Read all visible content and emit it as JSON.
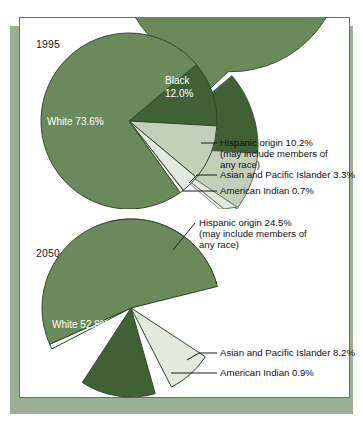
{
  "figure": {
    "title_alt": "U.S. population by race and Hispanic origin, 1995 and 2050",
    "colors": {
      "white_slice": "#6b8a5b",
      "black_slice": "#3f6135",
      "hispanic_slice": "#c3cfba",
      "asian_slice": "#e3e9de",
      "american_indian_slice": "#ffffff",
      "slice_outline": "#3f5436",
      "panel_border": "#5e7a56",
      "shadow_block": "#9bad93",
      "panel_background": "#ffffff",
      "text": "#111111",
      "slice_label_text": "#ffffff"
    }
  },
  "charts": [
    {
      "year_label": "1995",
      "inside_labels": [
        {
          "name": "black-slice-label",
          "text": "Black"
        },
        {
          "name": "black-slice-value",
          "text": "12.0%"
        },
        {
          "name": "white-slice-label",
          "text": "White 73.6%"
        }
      ],
      "annotations": [
        {
          "name": "hispanic-callout-line1",
          "text": "Hispanic origin 10.2%"
        },
        {
          "name": "hispanic-callout-line2",
          "text": "(may include members of"
        },
        {
          "name": "hispanic-callout-line3",
          "text": "any race)"
        },
        {
          "name": "asian-callout",
          "text": "Asian and Pacific Islander 3.3%"
        },
        {
          "name": "american-indian-callout",
          "text": "American Indian 0.7%"
        }
      ]
    },
    {
      "year_label": "2050",
      "inside_labels": [
        {
          "name": "black-slice-label",
          "text": "Black 13.6%"
        },
        {
          "name": "white-slice-label",
          "text": "White 52.8%"
        }
      ],
      "annotations": [
        {
          "name": "hispanic-callout-line1",
          "text": "Hispanic origin 24.5%"
        },
        {
          "name": "hispanic-callout-line2",
          "text": "(may include members of"
        },
        {
          "name": "hispanic-callout-line3",
          "text": "any race)"
        },
        {
          "name": "asian-callout",
          "text": "Asian and Pacific Islander 8.2%"
        },
        {
          "name": "american-indian-callout",
          "text": "American Indian 0.9%"
        }
      ]
    }
  ],
  "chart_data": [
    {
      "type": "pie",
      "title": "1995",
      "labels": [
        "White",
        "Black",
        "Hispanic origin",
        "Asian and Pacific Islander",
        "American Indian"
      ],
      "values": [
        73.6,
        12.0,
        10.2,
        3.3,
        0.7
      ],
      "value_labels": [
        "White 73.6%",
        "Black 12.0%",
        "Hispanic origin 10.2%",
        "Asian and Pacific Islander 3.3%",
        "American Indian 0.7%"
      ],
      "colors": [
        "#6b8a5b",
        "#3f6135",
        "#c3cfba",
        "#e3e9de",
        "#ffffff"
      ],
      "note": "Hispanic origin may include members of any race",
      "legend": "none",
      "units": "percent"
    },
    {
      "type": "pie",
      "title": "2050",
      "labels": [
        "White",
        "Black",
        "Hispanic origin",
        "Asian and Pacific Islander",
        "American Indian"
      ],
      "values": [
        52.8,
        13.6,
        24.5,
        8.2,
        0.9
      ],
      "value_labels": [
        "White 52.8%",
        "Black 13.6%",
        "Hispanic origin 24.5%",
        "Asian and Pacific Islander 8.2%",
        "American Indian 0.9%"
      ],
      "colors": [
        "#6b8a5b",
        "#3f6135",
        "#c3cfba",
        "#e3e9de",
        "#ffffff"
      ],
      "note": "Hispanic origin may include members of any race",
      "legend": "none",
      "units": "percent"
    }
  ]
}
